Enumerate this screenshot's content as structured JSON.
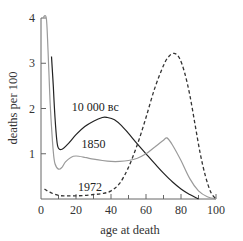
{
  "chart_data": {
    "type": "line",
    "title": "",
    "xlabel": "age at death",
    "ylabel": "deaths per 100",
    "xlim": [
      0,
      100
    ],
    "ylim": [
      0,
      4
    ],
    "x_ticks": [
      0,
      20,
      40,
      60,
      80,
      100
    ],
    "x_minor_ticks": [
      10,
      30,
      50,
      70,
      90
    ],
    "y_ticks": [
      1,
      2,
      3,
      4
    ],
    "grid": false,
    "legend": "inline-labels",
    "series": [
      {
        "name": "10 000 BC",
        "label": "10 000 вс",
        "style": "solid",
        "color": "#222222",
        "x": [
          6,
          7,
          8,
          9,
          10,
          12,
          15,
          20,
          25,
          30,
          35,
          38,
          42,
          46,
          50,
          55,
          60,
          65,
          70,
          75,
          80,
          85,
          90
        ],
        "y": [
          3.15,
          2.5,
          1.8,
          1.3,
          1.12,
          1.1,
          1.2,
          1.42,
          1.6,
          1.72,
          1.8,
          1.8,
          1.75,
          1.62,
          1.45,
          1.22,
          1.0,
          0.78,
          0.57,
          0.38,
          0.22,
          0.1,
          0.0
        ]
      },
      {
        "name": "1850",
        "label": "1850",
        "style": "solid",
        "color": "#9a9a9a",
        "x": [
          1,
          3,
          4,
          5,
          6,
          7,
          8,
          10,
          12,
          14,
          17,
          20,
          25,
          30,
          35,
          40,
          45,
          50,
          55,
          60,
          65,
          70,
          72,
          75,
          80,
          85,
          90,
          95,
          100
        ],
        "y": [
          4.0,
          4.0,
          3.3,
          2.3,
          1.6,
          1.05,
          0.78,
          0.66,
          0.7,
          0.82,
          0.92,
          0.95,
          0.92,
          0.88,
          0.85,
          0.83,
          0.83,
          0.85,
          0.9,
          1.0,
          1.15,
          1.3,
          1.35,
          1.2,
          0.85,
          0.45,
          0.18,
          0.05,
          0.0
        ]
      },
      {
        "name": "1972",
        "label": "1972",
        "style": "dashed",
        "color": "#333333",
        "x": [
          2,
          5,
          10,
          15,
          20,
          25,
          30,
          35,
          40,
          45,
          50,
          55,
          60,
          65,
          70,
          73,
          76,
          79,
          82,
          85,
          88,
          91,
          94,
          97,
          100
        ],
        "y": [
          0.22,
          0.15,
          0.08,
          0.07,
          0.07,
          0.08,
          0.1,
          0.12,
          0.18,
          0.35,
          0.7,
          1.2,
          1.8,
          2.45,
          2.95,
          3.15,
          3.22,
          3.12,
          2.8,
          2.3,
          1.65,
          1.0,
          0.5,
          0.15,
          0.0
        ]
      }
    ]
  }
}
